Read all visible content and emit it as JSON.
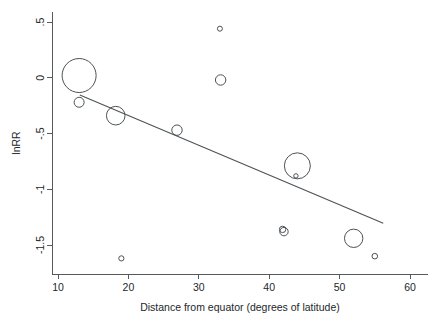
{
  "chart_data": {
    "type": "scatter",
    "title": "",
    "subtitle": "",
    "xlabel": "Distance from equator (degrees of latitude)",
    "ylabel": "lnRR",
    "xlim": [
      8.3,
      61.5
    ],
    "ylim": [
      -1.78,
      0.62
    ],
    "xticks": [
      10,
      20,
      30,
      40,
      50,
      60
    ],
    "xtick_labels": [
      "10",
      "20",
      "30",
      "40",
      "50",
      "60"
    ],
    "yticks": [
      0.5,
      0,
      -0.5,
      -1,
      -1.5
    ],
    "ytick_labels": [
      ".5",
      "0",
      "-.5",
      "-1",
      "-1.5"
    ],
    "grid": false,
    "legend": null,
    "marker_style": "open-circle-bubble",
    "size_encodes": "study weight",
    "points": [
      {
        "label": "study-1",
        "x": 13.0,
        "y": 0.02,
        "size": 17.0
      },
      {
        "label": "study-2",
        "x": 13.0,
        "y": -0.22,
        "size": 5.0
      },
      {
        "label": "study-3",
        "x": 18.2,
        "y": -0.34,
        "size": 9.3
      },
      {
        "label": "study-4",
        "x": 19.0,
        "y": -1.62,
        "size": 2.6
      },
      {
        "label": "study-5",
        "x": 26.9,
        "y": -0.47,
        "size": 5.2
      },
      {
        "label": "study-6",
        "x": 33.0,
        "y": 0.44,
        "size": 2.5
      },
      {
        "label": "study-7",
        "x": 33.1,
        "y": -0.02,
        "size": 5.2
      },
      {
        "label": "study-8",
        "x": 41.9,
        "y": -1.36,
        "size": 3.2
      },
      {
        "label": "study-9",
        "x": 42.1,
        "y": -1.38,
        "size": 4.2
      },
      {
        "label": "study-10",
        "x": 44.0,
        "y": -0.79,
        "size": 13.0
      },
      {
        "label": "study-11",
        "x": 43.8,
        "y": -0.88,
        "size": 2.2
      },
      {
        "label": "study-12",
        "x": 52.0,
        "y": -1.44,
        "size": 9.2
      },
      {
        "label": "study-13",
        "x": 55.0,
        "y": -1.6,
        "size": 2.8
      }
    ],
    "fit_line": {
      "label": "meta-regression-line",
      "x_start": 13.1,
      "y_start": -0.155,
      "x_end": 56.2,
      "y_end": -1.305
    },
    "colors": {
      "marker_stroke": "#4d5256",
      "line": "#4d5256",
      "axis": "#555a5e",
      "text": "#23272a",
      "background": "#ffffff"
    }
  }
}
